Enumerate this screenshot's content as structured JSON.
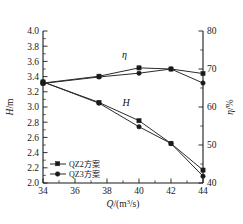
{
  "chart_data": {
    "type": "line",
    "title": "",
    "xlabel": "Q/(m³/s)",
    "ylabel": "H/m",
    "y2label": "η/%",
    "xlim": [
      34,
      44
    ],
    "ylim": [
      2.0,
      4.0
    ],
    "y2lim": [
      40,
      80
    ],
    "grid": false,
    "legend_position": "bottom-left",
    "x": [
      34,
      37.5,
      40,
      42,
      44
    ],
    "xticks": [
      "34",
      "36",
      "38",
      "40",
      "42",
      "44"
    ],
    "yticks": [
      "2.0",
      "2.2",
      "2.4",
      "2.6",
      "2.8",
      "3.0",
      "3.2",
      "3.4",
      "3.6",
      "3.8",
      "4.0"
    ],
    "y2ticks": [
      "40",
      "50",
      "60",
      "70",
      "80"
    ],
    "annotations": [
      {
        "text": "η",
        "x": 39.1,
        "y_axis": "right",
        "y": 73.0
      },
      {
        "text": "H",
        "x": 39.2,
        "y_axis": "left",
        "y": 3.02
      }
    ],
    "legend": [
      "QZ2方案",
      "QZ3方案"
    ],
    "series": [
      {
        "name": "QZ2方案",
        "quantity": "η",
        "axis": "right",
        "unit": "%",
        "values": [
          66.3,
          68.1,
          70.3,
          70.0,
          68.8
        ]
      },
      {
        "name": "QZ3方案",
        "quantity": "η",
        "axis": "right",
        "unit": "%",
        "values": [
          66.2,
          67.9,
          68.9,
          70.0,
          66.3
        ]
      },
      {
        "name": "QZ2方案",
        "quantity": "H",
        "axis": "left",
        "unit": "m",
        "values": [
          3.33,
          3.06,
          2.82,
          2.52,
          2.17
        ]
      },
      {
        "name": "QZ3方案",
        "quantity": "H",
        "axis": "left",
        "unit": "m",
        "values": [
          3.33,
          3.05,
          2.74,
          2.52,
          2.09
        ]
      }
    ]
  },
  "axes": {
    "x_label_main": "Q",
    "x_label_unit": "/(m",
    "x_label_sup": "3",
    "x_label_tail": "/s)",
    "y_label_main": "H",
    "y_label_unit": "/m",
    "y2_label_main": "η",
    "y2_label_unit": "/%"
  }
}
